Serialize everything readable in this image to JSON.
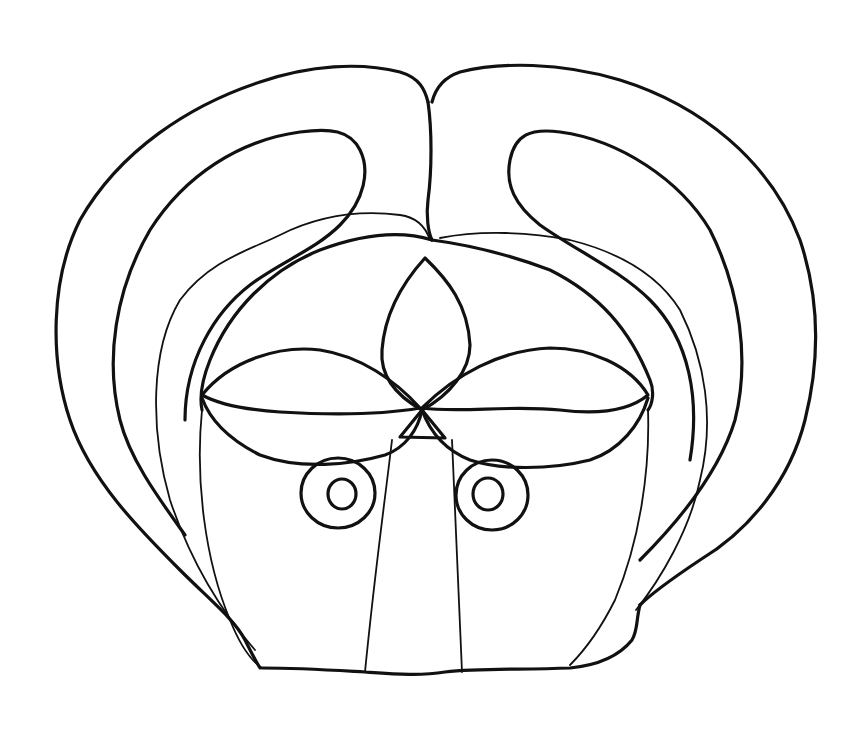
{
  "image": {
    "subject": "mask line drawing",
    "description": "Black line-art drawing of a stylized mask with large curved outer lobes, a central almond/teardrop shape, two leaf-shaped eye lids, two concentric ring eyes, and a trapezoidal nose band.",
    "colors": {
      "background": "#ffffff",
      "line": "#111111"
    }
  }
}
